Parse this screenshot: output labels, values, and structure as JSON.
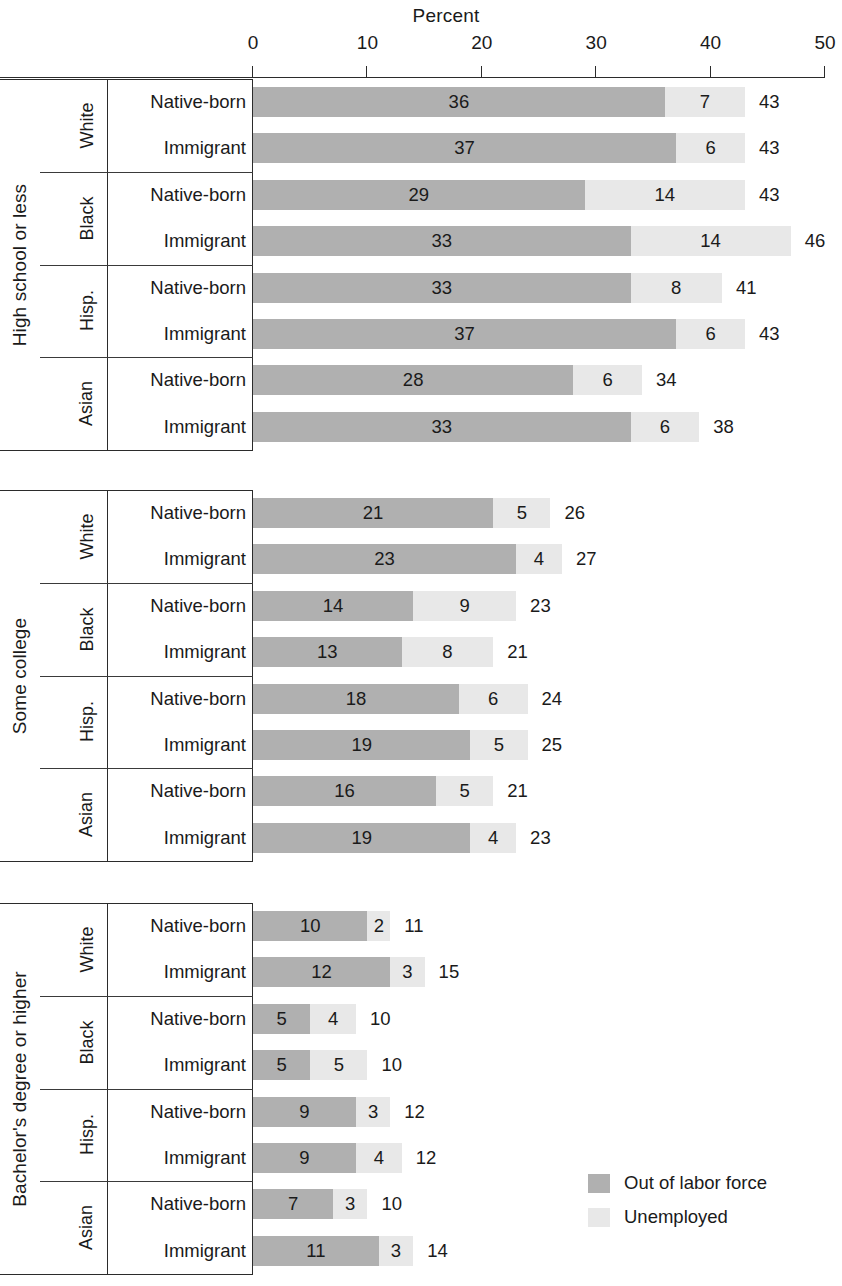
{
  "chart_data": {
    "type": "bar",
    "subtype": "stacked-horizontal",
    "title": "Percent",
    "xlabel": "Percent",
    "ylabel": "",
    "xlim": [
      0,
      50
    ],
    "xticks": [
      "0",
      "10",
      "20",
      "30",
      "40",
      "50"
    ],
    "grid": false,
    "legend_position": "bottom-right",
    "series": [
      {
        "name": "Out of labor force",
        "color": "#b0b0b0"
      },
      {
        "name": "Unemployed",
        "color": "#e8e8e8"
      }
    ],
    "groups": [
      {
        "education": "High school or less",
        "races": [
          {
            "race": "White",
            "rows": [
              {
                "nativity": "Native-born",
                "out_of_labor_force": 36,
                "unemployed": 7,
                "total": 43
              },
              {
                "nativity": "Immigrant",
                "out_of_labor_force": 37,
                "unemployed": 6,
                "total": 43
              }
            ]
          },
          {
            "race": "Black",
            "rows": [
              {
                "nativity": "Native-born",
                "out_of_labor_force": 29,
                "unemployed": 14,
                "total": 43
              },
              {
                "nativity": "Immigrant",
                "out_of_labor_force": 33,
                "unemployed": 14,
                "total": 46
              }
            ]
          },
          {
            "race": "Hisp.",
            "rows": [
              {
                "nativity": "Native-born",
                "out_of_labor_force": 33,
                "unemployed": 8,
                "total": 41
              },
              {
                "nativity": "Immigrant",
                "out_of_labor_force": 37,
                "unemployed": 6,
                "total": 43
              }
            ]
          },
          {
            "race": "Asian",
            "rows": [
              {
                "nativity": "Native-born",
                "out_of_labor_force": 28,
                "unemployed": 6,
                "total": 34
              },
              {
                "nativity": "Immigrant",
                "out_of_labor_force": 33,
                "unemployed": 6,
                "total": 38
              }
            ]
          }
        ]
      },
      {
        "education": "Some college",
        "races": [
          {
            "race": "White",
            "rows": [
              {
                "nativity": "Native-born",
                "out_of_labor_force": 21,
                "unemployed": 5,
                "total": 26
              },
              {
                "nativity": "Immigrant",
                "out_of_labor_force": 23,
                "unemployed": 4,
                "total": 27
              }
            ]
          },
          {
            "race": "Black",
            "rows": [
              {
                "nativity": "Native-born",
                "out_of_labor_force": 14,
                "unemployed": 9,
                "total": 23
              },
              {
                "nativity": "Immigrant",
                "out_of_labor_force": 13,
                "unemployed": 8,
                "total": 21
              }
            ]
          },
          {
            "race": "Hisp.",
            "rows": [
              {
                "nativity": "Native-born",
                "out_of_labor_force": 18,
                "unemployed": 6,
                "total": 24
              },
              {
                "nativity": "Immigrant",
                "out_of_labor_force": 19,
                "unemployed": 5,
                "total": 25
              }
            ]
          },
          {
            "race": "Asian",
            "rows": [
              {
                "nativity": "Native-born",
                "out_of_labor_force": 16,
                "unemployed": 5,
                "total": 21
              },
              {
                "nativity": "Immigrant",
                "out_of_labor_force": 19,
                "unemployed": 4,
                "total": 23
              }
            ]
          }
        ]
      },
      {
        "education": "Bachelor's degree or higher",
        "races": [
          {
            "race": "White",
            "rows": [
              {
                "nativity": "Native-born",
                "out_of_labor_force": 10,
                "unemployed": 2,
                "total": 11
              },
              {
                "nativity": "Immigrant",
                "out_of_labor_force": 12,
                "unemployed": 3,
                "total": 15
              }
            ]
          },
          {
            "race": "Black",
            "rows": [
              {
                "nativity": "Native-born",
                "out_of_labor_force": 5,
                "unemployed": 4,
                "total": 10
              },
              {
                "nativity": "Immigrant",
                "out_of_labor_force": 5,
                "unemployed": 5,
                "total": 10
              }
            ]
          },
          {
            "race": "Hisp.",
            "rows": [
              {
                "nativity": "Native-born",
                "out_of_labor_force": 9,
                "unemployed": 3,
                "total": 12
              },
              {
                "nativity": "Immigrant",
                "out_of_labor_force": 9,
                "unemployed": 4,
                "total": 12
              }
            ]
          },
          {
            "race": "Asian",
            "rows": [
              {
                "nativity": "Native-born",
                "out_of_labor_force": 7,
                "unemployed": 3,
                "total": 10
              },
              {
                "nativity": "Immigrant",
                "out_of_labor_force": 11,
                "unemployed": 3,
                "total": 14
              }
            ]
          }
        ]
      }
    ]
  }
}
